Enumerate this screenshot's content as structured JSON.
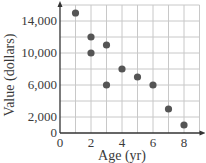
{
  "chart_data": {
    "type": "scatter",
    "title": "",
    "xlabel": "Age (yr)",
    "ylabel": "Value (dollars)",
    "xlim": [
      0,
      9
    ],
    "ylim": [
      0,
      16000
    ],
    "xticks": [
      0,
      2,
      4,
      6,
      8
    ],
    "xtick_labels": [
      "0",
      "2",
      "4",
      "6",
      "8"
    ],
    "yticks": [
      0,
      2000,
      6000,
      10000,
      14000
    ],
    "ytick_labels": [
      "0",
      "2,000",
      "6,000",
      "10,000",
      "14,000"
    ],
    "grid": true,
    "grid_x_step": 1,
    "grid_y_step": 2000,
    "legend": null,
    "points": [
      {
        "x": 1,
        "y": 15000
      },
      {
        "x": 2,
        "y": 12000
      },
      {
        "x": 2,
        "y": 10000
      },
      {
        "x": 3,
        "y": 11000
      },
      {
        "x": 3,
        "y": 6000
      },
      {
        "x": 4,
        "y": 8000
      },
      {
        "x": 5,
        "y": 7000
      },
      {
        "x": 6,
        "y": 6000
      },
      {
        "x": 7,
        "y": 3000
      },
      {
        "x": 8,
        "y": 1000
      }
    ],
    "colors": {
      "point": "#555555",
      "grid": "#c8c8c8",
      "axis": "#333333"
    }
  }
}
